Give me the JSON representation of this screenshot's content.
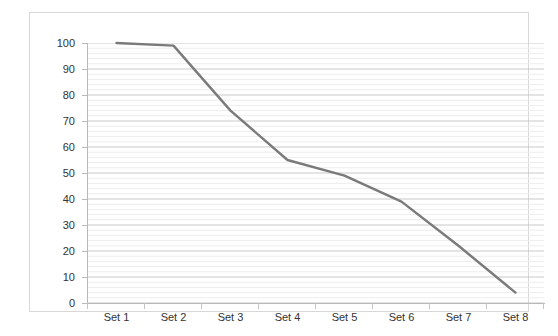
{
  "chart_data": {
    "type": "line",
    "title": "",
    "xlabel": "",
    "ylabel": "",
    "categories": [
      "Set 1",
      "Set 2",
      "Set 3",
      "Set 4",
      "Set 5",
      "Set 6",
      "Set 7",
      "Set 8"
    ],
    "values": [
      100,
      99,
      74,
      55,
      49,
      39,
      22,
      4
    ],
    "series": [
      {
        "name": "",
        "values": [
          100,
          99,
          74,
          55,
          49,
          39,
          22,
          4
        ],
        "color": "#7a7a7a"
      }
    ],
    "ylim": [
      0,
      100
    ],
    "y_ticks": [
      0,
      10,
      20,
      30,
      40,
      50,
      60,
      70,
      80,
      90,
      100
    ],
    "y_tick_labels": [
      "0",
      "10",
      "20",
      "30",
      "40",
      "50",
      "60",
      "70",
      "80",
      "90",
      "100"
    ],
    "y_minor_step": 2,
    "grid": true,
    "grid_major_color": "#c9c9c9",
    "grid_minor_color": "#ededed",
    "legend": false,
    "legend_position": "none",
    "markers": false,
    "line_width": 2.4,
    "axis_color": "#b9b9b9",
    "border_color": "#d8d8d8",
    "background": "#ffffff",
    "text_color": "#333333"
  }
}
